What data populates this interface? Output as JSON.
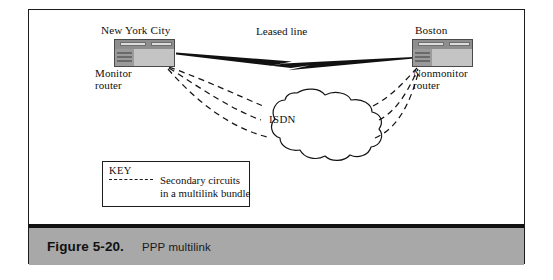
{
  "figure": {
    "caption_number": "Figure 5-20.",
    "caption_title": "PPP multilink"
  },
  "diagram": {
    "type": "network-topology",
    "nodes": [
      {
        "id": "nyc",
        "city_label": "New York City",
        "role_label_line1": "Monitor",
        "role_label_line2": "router",
        "icon": "router-icon"
      },
      {
        "id": "boston",
        "city_label": "Boston",
        "role_label_line1": "Nonmonitor",
        "role_label_line2": "router",
        "icon": "router-icon"
      },
      {
        "id": "isdn",
        "cloud_label": "ISDN",
        "icon": "cloud-icon"
      }
    ],
    "links": [
      {
        "id": "leased-line",
        "label": "Leased line",
        "style": "lightning-bolt",
        "from": "nyc",
        "to": "boston"
      },
      {
        "id": "secondary-circuit-1",
        "style": "dashed",
        "from": "nyc",
        "to": "boston",
        "via": "isdn"
      },
      {
        "id": "secondary-circuit-2",
        "style": "dashed",
        "from": "nyc",
        "to": "boston",
        "via": "isdn"
      },
      {
        "id": "secondary-circuit-3",
        "style": "dashed",
        "from": "nyc",
        "to": "boston",
        "via": "isdn"
      }
    ]
  },
  "key": {
    "title": "KEY",
    "dash_sample_label": "dashed-line-sample",
    "description_line1": "Secondary circuits",
    "description_line2": "in a multilink bundle"
  },
  "colors": {
    "frame_border": "#1c1c1c",
    "caption_band": "#a8a8a8",
    "caption_rule": "#111111",
    "router_body": "#c4c4c4",
    "router_header": "#8e8e8e",
    "ink": "#101010",
    "page_background": "#ffffff"
  }
}
